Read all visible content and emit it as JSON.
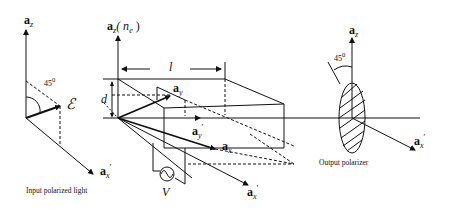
{
  "diagram": {
    "type": "electro-optic modulator schematic",
    "left_panel": {
      "axis_z_label": "a",
      "axis_z_sub": "z",
      "axis_x_label": "a",
      "axis_x_sub": "x",
      "axis_x_prime": "′",
      "angle_label": "45",
      "angle_unit": "0",
      "field_label": "ℰ",
      "caption": "Input polarized light"
    },
    "crystal": {
      "axis_z_label": "a",
      "axis_z_sub": "z",
      "axis_z_index": "( n",
      "axis_z_index_sub": "e",
      "axis_z_index_close": " )",
      "length_label": "l",
      "thickness_label": "d",
      "ay_label": "a",
      "ay_sub": "y",
      "ay_prime_label": "a",
      "ay_prime_sub": "y",
      "prime": "′",
      "ax_label": "a",
      "ax_sub": "x",
      "ax_prime_label": "a",
      "ax_prime_sub": "x",
      "voltage_label": "V"
    },
    "right_panel": {
      "axis_z_label": "a",
      "axis_z_sub": "z",
      "axis_x_label": "a",
      "axis_x_sub": "x",
      "prime": "′",
      "angle_label": "45",
      "angle_unit": "0",
      "caption": "Output polarizer"
    }
  }
}
